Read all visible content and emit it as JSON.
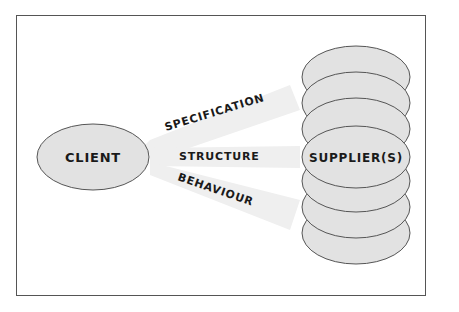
{
  "diagram": {
    "client": {
      "label": "CLIENT"
    },
    "supplier": {
      "label": "SUPPLIER(S)",
      "stack_count": 7
    },
    "links": [
      {
        "label": "SPECIFICATION"
      },
      {
        "label": "STRUCTURE"
      },
      {
        "label": "BEHAVIOUR"
      }
    ],
    "colors": {
      "ellipse_fill": "#e2e2e2",
      "ellipse_stroke": "#555555",
      "band_fill": "#eeeeee",
      "frame": "#555555",
      "text": "#1a1a1a"
    }
  }
}
